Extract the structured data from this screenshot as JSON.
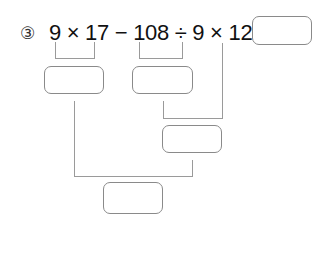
{
  "problem": {
    "number": "③",
    "expression": "9 × 17 − 108 ÷ 9 × 12 =",
    "terms": [
      "9 × 17",
      "108 ÷ 9",
      "12"
    ]
  },
  "answer_boxes": {
    "final_answer": "",
    "step_1": "",
    "step_2": "",
    "step_3": "",
    "step_4": ""
  }
}
